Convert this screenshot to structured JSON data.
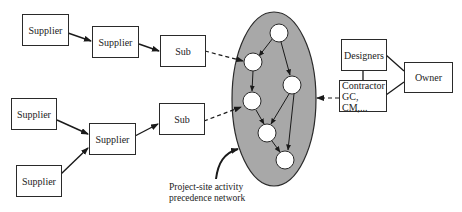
{
  "diagram": {
    "suppliers": [
      {
        "id": "s1",
        "label": "Supplier"
      },
      {
        "id": "s2",
        "label": "Supplier"
      },
      {
        "id": "s3",
        "label": "Supplier"
      },
      {
        "id": "s4",
        "label": "Supplier"
      },
      {
        "id": "s5",
        "label": "Supplier"
      }
    ],
    "subs": [
      {
        "id": "sub1",
        "label": "Sub"
      },
      {
        "id": "sub2",
        "label": "Sub"
      }
    ],
    "stakeholders": {
      "designers": "Designers",
      "owner": "Owner",
      "contractor_line1": "Contractor",
      "contractor_line2": "GC, CM,..."
    },
    "network_label": {
      "line1": "Project-site activity",
      "line2": "precedence network"
    },
    "colors": {
      "ellipse_fill": "#a8a8a8",
      "stroke": "#2a2a2a",
      "node_fill": "#ffffff"
    },
    "network_nodes": 7
  }
}
